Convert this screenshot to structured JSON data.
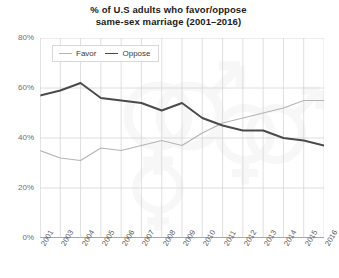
{
  "chart_data": {
    "type": "line",
    "title": "% of U.S adults who favor/oppose same-sex marriage (2001–2016)",
    "title_line1": "% of U.S adults who favor/oppose",
    "title_line2": "same-sex marriage (2001–2016)",
    "xlabel": "",
    "ylabel": "",
    "ylim": [
      0,
      80
    ],
    "yticks": [
      "0%",
      "20%",
      "40%",
      "60%",
      "80%"
    ],
    "ytick_values": [
      0,
      20,
      40,
      60,
      80
    ],
    "grid": true,
    "legend_position": "top-left",
    "categories": [
      "2001",
      "2003",
      "2004",
      "2005",
      "2006",
      "2007",
      "2008",
      "2009",
      "2010",
      "2011",
      "2012",
      "2013",
      "2014",
      "2015",
      "2016"
    ],
    "series": [
      {
        "name": "Favor",
        "color": "#b4b4b4",
        "values": [
          35,
          32,
          31,
          36,
          35,
          37,
          39,
          37,
          42,
          46,
          48,
          50,
          52,
          55,
          55
        ]
      },
      {
        "name": "Oppose",
        "color": "#4a4a4a",
        "values": [
          57,
          59,
          62,
          56,
          55,
          54,
          51,
          54,
          48,
          45,
          43,
          43,
          40,
          39,
          37
        ]
      }
    ]
  },
  "legend": {
    "items": [
      {
        "label": "Favor",
        "color": "#b4b4b4"
      },
      {
        "label": "Oppose",
        "color": "#4a4a4a"
      }
    ]
  },
  "colors": {
    "favor": "#b4b4b4",
    "oppose": "#4a4a4a",
    "grid": "#d5d5d5",
    "axis": "#8a8a8a",
    "title": "#1b1b1b",
    "tick_text": "#6e6e6e",
    "background": "#ffffff",
    "watermark": "#f2f2f2"
  }
}
